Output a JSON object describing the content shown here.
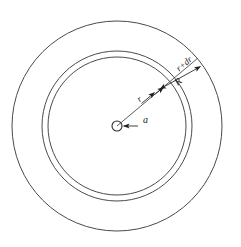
{
  "figure": {
    "background_color": "#ffffff",
    "stroke_color": "#4a4a4a",
    "label_color": "#1a1a1a",
    "width": 241,
    "height": 247,
    "center": {
      "x": 117,
      "y": 126
    }
  },
  "labels": {
    "inner_radius_a": "a",
    "radius_r": "r",
    "radius_r_plus_dr": "r+dr",
    "outer_radius_R": "R"
  },
  "geometry": {
    "circles": [
      {
        "name": "core-circle",
        "label": "a",
        "radius": 5
      },
      {
        "name": "radius-r-circle",
        "label": "r",
        "radius": 69
      },
      {
        "name": "radius-r-plus-dr-circle",
        "label": "r+dr",
        "radius": 75
      },
      {
        "name": "outer-radius-R-circle",
        "label": "R",
        "radius": 105
      }
    ],
    "radial_line_angle_deg": -40
  }
}
